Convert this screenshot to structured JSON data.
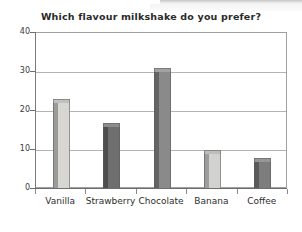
{
  "chart_data": {
    "type": "bar",
    "title": "Which flavour milkshake do you prefer?",
    "xlabel": "",
    "ylabel": "",
    "categories": [
      "Vanilla",
      "Strawberry",
      "Chocolate",
      "Banana",
      "Coffee"
    ],
    "values": [
      23,
      17,
      31,
      10,
      8
    ],
    "ylim": [
      0,
      40
    ],
    "yticks": [
      0,
      10,
      20,
      30,
      40
    ],
    "ytick_labels": [
      "0",
      "10",
      "20",
      "30",
      "40"
    ],
    "grid": true,
    "legend": false,
    "bar_colors": [
      "#d8d6d2",
      "#6f6f6f",
      "#8a8a8a",
      "#d2d2d0",
      "#7d7d7d"
    ],
    "bar_side_colors": [
      "#9b9b97",
      "#4e4e4e",
      "#646464",
      "#9d9d9b",
      "#5a5a5a"
    ],
    "bar_top_colors": [
      "#c2c0bc",
      "#8c8c8c",
      "#a2a2a2",
      "#bdbdbb",
      "#979797"
    ]
  }
}
